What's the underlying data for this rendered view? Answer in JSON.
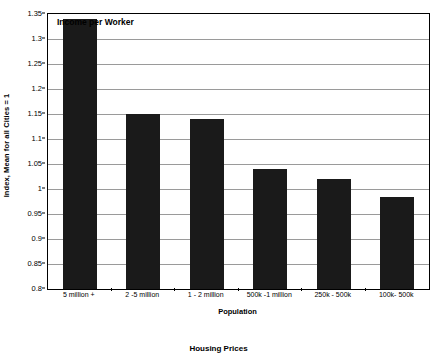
{
  "chart_data": {
    "type": "bar",
    "title": "Income per Worker",
    "xlabel": "Population",
    "ylabel": "Index, Mean for all Cities = 1",
    "categories": [
      "5 million +",
      "2 -5 million",
      "1 - 2 million",
      "500k -1 million",
      "250k - 500k",
      "100k- 500k"
    ],
    "values": [
      1.34,
      1.15,
      1.14,
      1.04,
      1.02,
      0.985
    ],
    "ylim": [
      0.8,
      1.35
    ],
    "ytick_labels": [
      "1.35",
      "1.3",
      "1.25",
      "1.2",
      "1.15",
      "1.1",
      "1.05",
      "1",
      "0.95",
      "0.9",
      "0.85",
      "0.8"
    ],
    "ytick_values": [
      1.35,
      1.3,
      1.25,
      1.2,
      1.15,
      1.1,
      1.05,
      1.0,
      0.95,
      0.9,
      0.85,
      0.8
    ],
    "grid": true,
    "legend": "none",
    "bar_color": "#1a1a1a",
    "grid_color": "#9a9a9a",
    "axis_color": "#000000"
  },
  "caption": {
    "text": "Housing Prices"
  }
}
